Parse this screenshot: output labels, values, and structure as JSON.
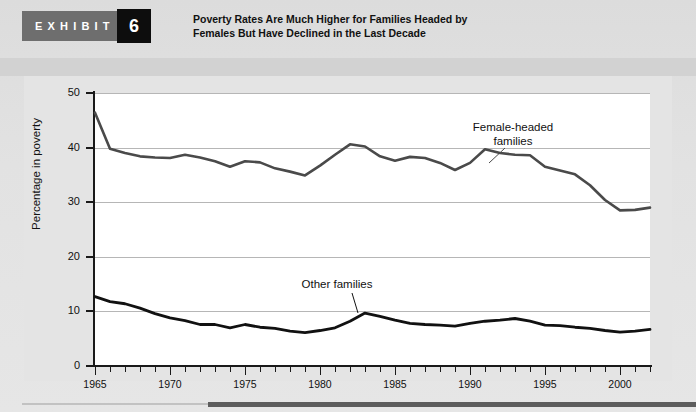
{
  "exhibit": {
    "label": "EXHIBIT",
    "number": "6",
    "title_line1": "Poverty Rates Are Much Higher for Families Headed by",
    "title_line2": "Females But Have Declined in the Last Decade"
  },
  "annotations": {
    "female_line1": "Female-headed",
    "female_line2": "families",
    "other": "Other families"
  },
  "colors": {
    "header_band": "#6e6e6e",
    "number_box": "#0d0d0d",
    "page_bg": "#e2e2e2",
    "plot_bg": "#ffffff",
    "axis": "#1a1a1a",
    "gridline": "#b6b6b6",
    "series_female": "#4a4a4a",
    "series_other": "#111111",
    "bottom_rule": "#5d5d5d"
  },
  "chart_data": {
    "type": "line",
    "title": "Poverty Rates Are Much Higher for Families Headed by Females But Have Declined in the Last Decade",
    "xlabel": "",
    "ylabel": "Percentage in poverty",
    "xlim": [
      1965,
      2002
    ],
    "ylim": [
      0,
      50
    ],
    "yticks": [
      0,
      10,
      20,
      30,
      40,
      50
    ],
    "xticks": [
      1965,
      1970,
      1975,
      1980,
      1985,
      1990,
      1995,
      2000
    ],
    "xtick_step_minor": 1,
    "grid": true,
    "legend": "inline-annotations",
    "x": [
      1965,
      1966,
      1967,
      1968,
      1969,
      1970,
      1971,
      1972,
      1973,
      1974,
      1975,
      1976,
      1977,
      1978,
      1979,
      1980,
      1981,
      1982,
      1983,
      1984,
      1985,
      1986,
      1987,
      1988,
      1989,
      1990,
      1991,
      1992,
      1993,
      1994,
      1995,
      1996,
      1997,
      1998,
      1999,
      2000,
      2001,
      2002
    ],
    "series": [
      {
        "name": "Female-headed families",
        "values": [
          46.4,
          39.8,
          39.0,
          38.4,
          38.2,
          38.1,
          38.7,
          38.2,
          37.5,
          36.5,
          37.5,
          37.3,
          36.2,
          35.6,
          34.9,
          36.7,
          38.7,
          40.6,
          40.2,
          38.4,
          37.6,
          38.3,
          38.1,
          37.2,
          35.9,
          37.2,
          39.7,
          39.0,
          38.7,
          38.6,
          36.5,
          35.8,
          35.1,
          33.1,
          30.4,
          28.5,
          28.6,
          29.0
        ]
      },
      {
        "name": "Other families",
        "values": [
          12.7,
          11.8,
          11.4,
          10.6,
          9.6,
          8.8,
          8.3,
          7.6,
          7.6,
          7.0,
          7.6,
          7.1,
          6.9,
          6.4,
          6.1,
          6.5,
          7.0,
          8.2,
          9.7,
          9.1,
          8.4,
          7.8,
          7.6,
          7.5,
          7.3,
          7.8,
          8.2,
          8.4,
          8.7,
          8.2,
          7.5,
          7.4,
          7.1,
          6.9,
          6.5,
          6.2,
          6.4,
          6.7
        ]
      }
    ]
  }
}
